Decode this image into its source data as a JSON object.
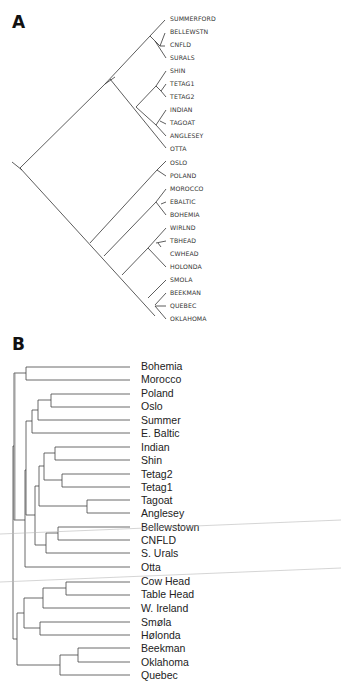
{
  "figure": {
    "panel_a": {
      "label": "A",
      "type": "slanted cladogram",
      "leaves": [
        "SUMMERFORD",
        "BELLEWSTN",
        "CNFLD",
        "SURALS",
        "SHIN",
        "TETAG1",
        "TETAG2",
        "INDIAN",
        "TAGOAT",
        "ANGLESEY",
        "OTTA",
        "OSLO",
        "POLAND",
        "MOROCCO",
        "EBALTIC",
        "BOHEMIA",
        "WIRLND",
        "TBHEAD",
        "CWHEAD",
        "HOLONDA",
        "SMOLA",
        "BEEKMAN",
        "QUEBEC",
        "OKLAHOMA"
      ]
    },
    "panel_b": {
      "label": "B",
      "type": "rectangular dendrogram",
      "leaves": [
        "Bohemia",
        "Morocco",
        "Poland",
        "Oslo",
        "Summer",
        "E. Baltic",
        "Indian",
        "Shin",
        "Tetag2",
        "Tetag1",
        "Tagoat",
        "Anglesey",
        "Bellewstown",
        "CNFLD",
        "S. Urals",
        "Otta",
        "Cow Head",
        "Table Head",
        "W. Ireland",
        "Smøla",
        "Hølonda",
        "Beekman",
        "Oklahoma",
        "Quebec"
      ]
    }
  }
}
